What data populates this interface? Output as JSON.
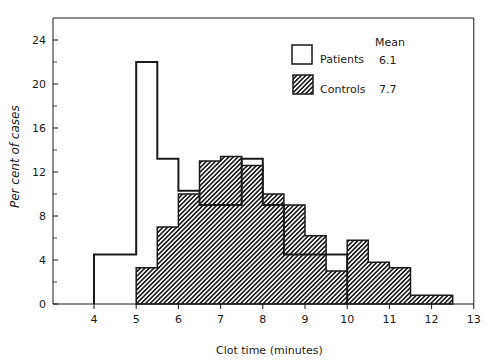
{
  "chart_data": {
    "type": "bar",
    "subtype": "overlaid-histogram",
    "title": "",
    "xlabel": "Clot time (minutes)",
    "ylabel": "Per cent of cases",
    "xlim": [
      3,
      13
    ],
    "ylim": [
      0,
      26
    ],
    "x_ticks": [
      4,
      5,
      6,
      7,
      8,
      9,
      10,
      11,
      12,
      13
    ],
    "y_ticks": [
      0,
      4,
      8,
      12,
      16,
      20,
      24
    ],
    "y_minor_ticks": [
      2,
      6,
      10,
      14,
      18,
      22
    ],
    "grid": false,
    "legend_position": "upper-right",
    "legend_header": "Mean",
    "series": [
      {
        "name": "Patients",
        "mean": "6.1",
        "style": "outline",
        "bins": [
          {
            "from": 4.0,
            "to": 5.0,
            "value": 4.5
          },
          {
            "from": 5.0,
            "to": 5.5,
            "value": 22.0
          },
          {
            "from": 5.5,
            "to": 6.0,
            "value": 13.2
          },
          {
            "from": 6.0,
            "to": 6.5,
            "value": 10.3
          },
          {
            "from": 6.5,
            "to": 7.5,
            "value": 9.0
          },
          {
            "from": 7.5,
            "to": 8.0,
            "value": 13.2
          },
          {
            "from": 8.0,
            "to": 8.5,
            "value": 9.0
          },
          {
            "from": 8.5,
            "to": 10.0,
            "value": 4.5
          }
        ]
      },
      {
        "name": "Controls",
        "mean": "7.7",
        "style": "hatched",
        "bins": [
          {
            "from": 5.0,
            "to": 5.5,
            "value": 3.3
          },
          {
            "from": 5.5,
            "to": 6.0,
            "value": 7.0
          },
          {
            "from": 6.0,
            "to": 6.5,
            "value": 10.0
          },
          {
            "from": 6.5,
            "to": 7.0,
            "value": 13.0
          },
          {
            "from": 7.0,
            "to": 7.5,
            "value": 13.4
          },
          {
            "from": 7.5,
            "to": 8.0,
            "value": 12.6
          },
          {
            "from": 8.0,
            "to": 8.5,
            "value": 10.0
          },
          {
            "from": 8.5,
            "to": 9.0,
            "value": 9.0
          },
          {
            "from": 9.0,
            "to": 9.5,
            "value": 6.2
          },
          {
            "from": 9.5,
            "to": 10.0,
            "value": 3.0
          },
          {
            "from": 10.0,
            "to": 10.5,
            "value": 5.8
          },
          {
            "from": 10.5,
            "to": 11.0,
            "value": 3.8
          },
          {
            "from": 11.0,
            "to": 11.5,
            "value": 3.3
          },
          {
            "from": 11.5,
            "to": 12.5,
            "value": 0.8
          }
        ]
      }
    ]
  },
  "legend": {
    "header": "Mean",
    "items": [
      {
        "label": "Patients",
        "mean": "6.1"
      },
      {
        "label": "Controls",
        "mean": "7.7"
      }
    ]
  },
  "axes": {
    "xlabel": "Clot time (minutes)",
    "ylabel": "Per cent of cases"
  },
  "colors": {
    "ink": "#1a1a1a",
    "background": "#ffffff"
  }
}
